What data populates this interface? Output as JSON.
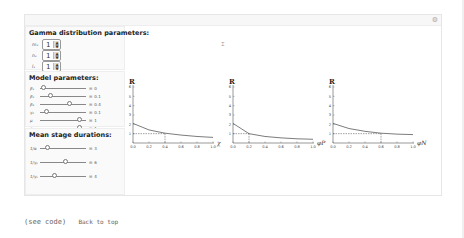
{
  "gamma": {
    "title": "Gamma distribution parameters:",
    "params": [
      {
        "label": "mₓ",
        "value": "1"
      },
      {
        "label": "nₓ",
        "value": "1"
      },
      {
        "label": "lₓ",
        "value": "1"
      }
    ]
  },
  "model": {
    "title": "Model parameters:",
    "params": [
      {
        "label": "β₁",
        "value": "0",
        "pos": 0.02
      },
      {
        "label": "β₂",
        "value": "0.1",
        "pos": 0.2
      },
      {
        "label": "β₃",
        "value": "0.4",
        "pos": 0.65
      },
      {
        "label": "γ₂",
        "value": "0.1",
        "pos": 0.1
      },
      {
        "label": "μ",
        "value": "1",
        "pos": 0.9
      },
      {
        "label": "ε₁",
        "value": "1",
        "pos": 0.9
      }
    ]
  },
  "durations": {
    "title": "Mean stage durations:",
    "params": [
      {
        "label": "1/α",
        "value": "3",
        "pos": 0.12
      },
      {
        "label": "1/γₚ",
        "value": "6",
        "pos": 0.55
      },
      {
        "label": "1/γₙ",
        "value": "4",
        "pos": 0.3
      }
    ]
  },
  "footer": {
    "see_code": "(see code)",
    "back_to_top": "Back to top"
  },
  "chart_data": [
    {
      "type": "line",
      "title": "",
      "ylabel": "R₀",
      "xlabel": "χ",
      "ylim": [
        0,
        6
      ],
      "xlim": [
        0,
        1
      ],
      "xticks": [
        "0.0",
        "0.2",
        "0.4",
        "0.6",
        "0.8",
        "1.0"
      ],
      "yticks": [
        "1",
        "2",
        "3",
        "4",
        "5",
        "6"
      ],
      "x": [
        0,
        0.2,
        0.4,
        0.6,
        0.8,
        1.0
      ],
      "values": [
        2.1,
        1.4,
        1.05,
        0.85,
        0.7,
        0.6
      ],
      "threshold_line": 1,
      "threshold_x": 0.4
    },
    {
      "type": "line",
      "title": "",
      "ylabel": "R₀",
      "xlabel": "φ_P",
      "ylim": [
        0,
        6
      ],
      "xlim": [
        0,
        1
      ],
      "xticks": [
        "0.0",
        "0.2",
        "0.4",
        "0.6",
        "0.8",
        "1.0"
      ],
      "yticks": [
        "1",
        "2",
        "3",
        "4",
        "5",
        "6"
      ],
      "x": [
        0,
        0.2,
        0.4,
        0.6,
        0.8,
        1.0
      ],
      "values": [
        2.1,
        1.0,
        0.7,
        0.55,
        0.45,
        0.4
      ],
      "threshold_line": 1,
      "threshold_x": 0.2
    },
    {
      "type": "line",
      "title": "",
      "ylabel": "R₀",
      "xlabel": "φ_N",
      "ylim": [
        0,
        6
      ],
      "xlim": [
        0,
        1
      ],
      "xticks": [
        "0.0",
        "0.2",
        "0.4",
        "0.6",
        "0.8",
        "1.0"
      ],
      "yticks": [
        "1",
        "2",
        "3",
        "4",
        "5",
        "6"
      ],
      "x": [
        0,
        0.2,
        0.4,
        0.6,
        0.8,
        1.0
      ],
      "values": [
        2.1,
        1.55,
        1.25,
        1.05,
        0.95,
        0.9
      ],
      "threshold_line": 1,
      "threshold_x": 0.6
    }
  ]
}
